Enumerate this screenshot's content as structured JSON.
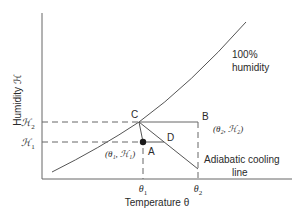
{
  "diagram": {
    "type": "psychrometric-sketch",
    "axes": {
      "x_label": "Temperature θ",
      "y_label": "Humidity ℋ",
      "x_ticks": [
        {
          "main": "θ",
          "sub": "1"
        },
        {
          "main": "θ",
          "sub": "2"
        }
      ],
      "y_ticks": [
        {
          "main": "ℋ",
          "sub": "2"
        },
        {
          "main": "ℋ",
          "sub": "1"
        }
      ]
    },
    "curve": {
      "label_line1": "100%",
      "label_line2": "humidity"
    },
    "points": {
      "A": {
        "label": "A",
        "coords": "(θ₁, ℋ₁)"
      },
      "B": {
        "label": "B",
        "coords": "(θ₂, ℋ₂)"
      },
      "C": {
        "label": "C"
      },
      "D": {
        "label": "D"
      }
    },
    "adiabatic": {
      "label_line1": "Adiabatic cooling",
      "label_line2": "line"
    },
    "colors": {
      "line": "#555555",
      "text": "#2a2a2a",
      "dot": "#1a1a1a"
    }
  }
}
